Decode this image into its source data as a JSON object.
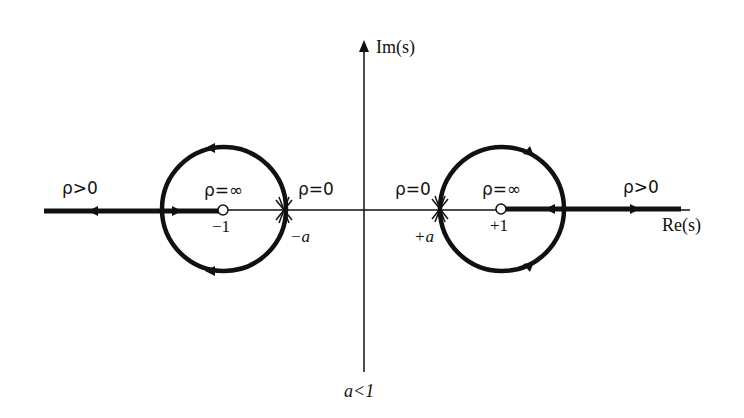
{
  "diagram": {
    "colors": {
      "ink": "#111111",
      "background": "#ffffff"
    },
    "axes": {
      "real_label": "Re(s)",
      "imag_label": "Im(s)",
      "condition_label": "a<1"
    },
    "left": {
      "branch_label": "ρ>0",
      "zero_gain_label": "ρ=0",
      "inf_gain_label": "ρ=∞",
      "zero_label": "−1",
      "pole_label": "−a"
    },
    "right": {
      "branch_label": "ρ>0",
      "zero_gain_label": "ρ=0",
      "inf_gain_label": "ρ=∞",
      "zero_label": "+1",
      "pole_label": "+a"
    },
    "markers": {
      "zero_icon": "open-circle",
      "double_pole_icon": "double-cross"
    }
  }
}
